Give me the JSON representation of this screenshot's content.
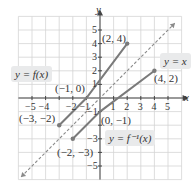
{
  "chart_data": {
    "type": "line",
    "title": "",
    "xlabel": "x",
    "ylabel": "y",
    "xlim": [
      -6,
      6
    ],
    "ylim": [
      -6,
      6
    ],
    "grid": true,
    "x_ticks": [
      "-5",
      "-4",
      "-2",
      "-1",
      "1",
      "2",
      "3",
      "4",
      "5"
    ],
    "y_ticks": [
      "5",
      "4",
      "3",
      "2",
      "1",
      "-1",
      "-3",
      "-5"
    ],
    "series": [
      {
        "name": "y = f(x)",
        "points": [
          [
            -3,
            -2
          ],
          [
            -1,
            0
          ],
          [
            2,
            4
          ]
        ],
        "style": "solid",
        "color": "#7a7a7a"
      },
      {
        "name": "y = f^-1(x)",
        "points": [
          [
            -2,
            -3
          ],
          [
            0,
            -1
          ],
          [
            4,
            2
          ]
        ],
        "style": "solid",
        "color": "#7a7a7a"
      },
      {
        "name": "y = x",
        "points": [
          [
            -5.8,
            -5.8
          ],
          [
            5.5,
            5.5
          ]
        ],
        "style": "dashed",
        "color": "#8a8a8a"
      }
    ],
    "annotations": [
      "(2, 4)",
      "(-1, 0)",
      "(-3, -2)",
      "(4, 2)",
      "(0, -1)",
      "(-2, -3)"
    ]
  },
  "axes": {
    "x_label": "x",
    "y_label": "y"
  },
  "ticks": {
    "x": [
      {
        "v": -5,
        "t": "−5"
      },
      {
        "v": -4,
        "t": "−4"
      },
      {
        "v": -2,
        "t": "−2"
      },
      {
        "v": -1,
        "t": "−1"
      },
      {
        "v": 1,
        "t": "1"
      },
      {
        "v": 2,
        "t": "2"
      },
      {
        "v": 3,
        "t": "3"
      },
      {
        "v": 4,
        "t": "4"
      },
      {
        "v": 5,
        "t": "5"
      }
    ],
    "y": [
      {
        "v": 5,
        "t": "5"
      },
      {
        "v": 4,
        "t": "4"
      },
      {
        "v": 3,
        "t": "3"
      },
      {
        "v": 2,
        "t": "2"
      },
      {
        "v": 1,
        "t": "1"
      },
      {
        "v": -1,
        "t": "−1"
      },
      {
        "v": -3,
        "t": "−3"
      },
      {
        "v": -5,
        "t": "−5"
      }
    ]
  },
  "labels": {
    "f": "y = f(x)",
    "finv": "y = f⁻¹(x)",
    "identity": "y = x",
    "p_2_4": "(2, 4)",
    "p_m1_0": "(−1, 0)",
    "p_m3_m2": "(−3, −2)",
    "p_4_2": "(4, 2)",
    "p_0_m1": "(0, −1)",
    "p_m2_m3": "(−2, −3)"
  },
  "colors": {
    "grid": "#d4d4d4",
    "axis": "#444444",
    "curve": "#7a7a7a",
    "dashed": "#8a8a8a",
    "label_bg": "#e9eaeb"
  }
}
